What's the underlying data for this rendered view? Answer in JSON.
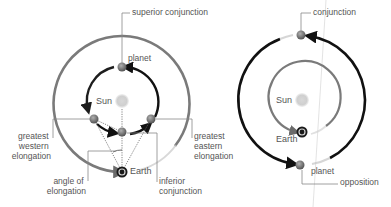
{
  "colors": {
    "background": "#ffffff",
    "orbit_gray": "#8a8a8a",
    "arrow_black": "#111111",
    "label_text": "#555555",
    "sun": "#cccccc",
    "leader_line": "#888888"
  },
  "left_diagram": {
    "title": "inferior planet configurations",
    "labels": {
      "superior_conjunction": "superior conjunction",
      "planet": "planet",
      "sun": "Sun",
      "greatest_western_elongation": [
        "greatest",
        "western",
        "elongation"
      ],
      "greatest_eastern_elongation": [
        "greatest",
        "eastern",
        "elongation"
      ],
      "angle_of_elongation": [
        "angle of",
        "elongation"
      ],
      "earth": "Earth",
      "inferior_conjunction": [
        "inferior",
        "conjunction"
      ]
    }
  },
  "right_diagram": {
    "title": "superior planet configurations",
    "labels": {
      "conjunction": "conjunction",
      "sun": "Sun",
      "earth": "Earth",
      "planet": "planet",
      "opposition": "opposition"
    }
  }
}
